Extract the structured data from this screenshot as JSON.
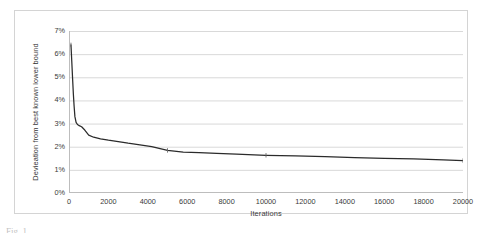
{
  "figure": {
    "caption_fragment": "Fig. 1"
  },
  "chart_data": {
    "type": "line",
    "title": "",
    "xlabel": "Iterations",
    "ylabel": "Devieation from best known lower bound",
    "xlim": [
      0,
      20000
    ],
    "ylim": [
      0,
      0.07
    ],
    "grid": "horizontal",
    "legend": "none",
    "y_tick_labels": [
      "0%",
      "1%",
      "2%",
      "3%",
      "4%",
      "5%",
      "6%",
      "7%"
    ],
    "y_tick_values": [
      0,
      0.01,
      0.02,
      0.03,
      0.04,
      0.05,
      0.06,
      0.07
    ],
    "x_tick_labels": [
      "0",
      "2000",
      "4000",
      "6000",
      "8000",
      "10000",
      "12000",
      "14000",
      "16000",
      "18000",
      "20000"
    ],
    "x_tick_values": [
      0,
      2000,
      4000,
      6000,
      8000,
      10000,
      12000,
      14000,
      16000,
      18000,
      20000
    ],
    "series": [
      {
        "name": "Deviation",
        "color": "#2b2b2b",
        "marker": "tick",
        "x": [
          100,
          140,
          180,
          220,
          260,
          300,
          360,
          430,
          520,
          640,
          800,
          1000,
          1250,
          1600,
          2000,
          2500,
          3000,
          3600,
          4200,
          5000,
          5800,
          6600,
          7500,
          8500,
          10000,
          11500,
          13000,
          14500,
          16000,
          17500,
          19000,
          20000
        ],
        "y": [
          0.064,
          0.057,
          0.0498,
          0.043,
          0.0375,
          0.033,
          0.0305,
          0.0296,
          0.0291,
          0.0286,
          0.0272,
          0.025,
          0.0241,
          0.0234,
          0.0228,
          0.0222,
          0.0215,
          0.0208,
          0.02,
          0.0184,
          0.0177,
          0.0174,
          0.0171,
          0.0168,
          0.0163,
          0.016,
          0.0157,
          0.0153,
          0.015,
          0.0147,
          0.0143,
          0.014
        ]
      }
    ],
    "markers": [
      {
        "x": 100,
        "y": 0.064
      },
      {
        "x": 5000,
        "y": 0.0184
      },
      {
        "x": 10000,
        "y": 0.0163
      },
      {
        "x": 20000,
        "y": 0.014
      }
    ]
  }
}
